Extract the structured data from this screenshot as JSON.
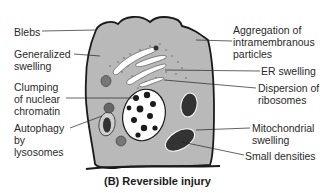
{
  "caption": "(B)  Reversible injury",
  "labels": {
    "left": [
      {
        "id": "blebs",
        "text": "Blebs"
      },
      {
        "id": "generalized-swelling",
        "text": "Generalized\nswelling"
      },
      {
        "id": "clumping-chromatin",
        "text": "Clumping\nof nuclear\nchromatin"
      },
      {
        "id": "autophagy",
        "text": "Autophagy\nby\nlysosomes"
      }
    ],
    "right": [
      {
        "id": "aggregation",
        "text": "Aggregation of\nintramembranous\nparticles"
      },
      {
        "id": "er-swelling",
        "text": "ER swelling"
      },
      {
        "id": "dispersion-ribosomes",
        "text": "Dispersion of\nribosomes"
      },
      {
        "id": "mitochondrial-swelling",
        "text": "Mitochondrial\nswelling"
      },
      {
        "id": "small-densities",
        "text": "Small densities"
      }
    ]
  },
  "colors": {
    "cytoplasm": "#b9b9b9",
    "outline": "#1a1a1a",
    "text": "#2a2a2a"
  }
}
